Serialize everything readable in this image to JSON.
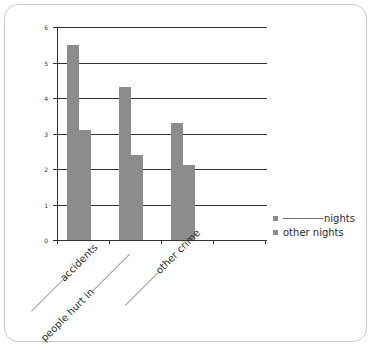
{
  "chart_data": {
    "type": "bar",
    "title": "",
    "xlabel": "",
    "ylabel": "",
    "ylim": [
      0,
      6
    ],
    "yticks": [
      "0",
      "1",
      "2",
      "3",
      "4",
      "5",
      "6"
    ],
    "grid": true,
    "legend_position": "right",
    "categories": [
      "_____ accidents",
      "people hurt in _____",
      "_____ other crime"
    ],
    "category_labels": [
      {
        "blank_before": true,
        "text": "accidents",
        "blank_after": false
      },
      {
        "blank_before": false,
        "text": "people hurt in",
        "blank_after": true
      },
      {
        "blank_before": true,
        "text": "other crime",
        "blank_after": false
      }
    ],
    "series": [
      {
        "name": "_____ nights",
        "values": [
          5.5,
          4.3,
          3.3
        ],
        "color": "#8c8c8c"
      },
      {
        "name": "other nights",
        "values": [
          3.1,
          2.4,
          2.1
        ],
        "color": "#8c8c8c"
      }
    ]
  },
  "legend": {
    "items": [
      {
        "blank": true,
        "label": "nights"
      },
      {
        "blank": false,
        "label": "other nights"
      }
    ]
  },
  "colors": {
    "bar": "#8c8c8c",
    "axis": "#333333",
    "frame": "#c9c9c9",
    "text": "#2b2b2b",
    "blank_rule": "#9a9a9a"
  }
}
